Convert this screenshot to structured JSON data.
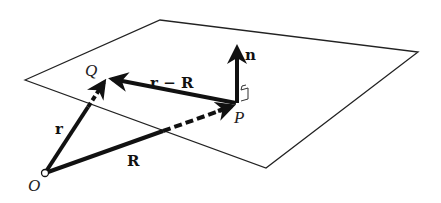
{
  "diagram": {
    "type": "vector-plane-geometry",
    "colors": {
      "stroke": "#111111",
      "background": "#ffffff"
    },
    "plane": {
      "corners": [
        [
          25,
          80
        ],
        [
          160,
          20
        ],
        [
          418,
          52
        ],
        [
          266,
          168
        ]
      ]
    },
    "points": {
      "O": {
        "label": "O",
        "x": 45,
        "y": 173
      },
      "Q": {
        "label": "Q",
        "x": 106,
        "y": 78
      },
      "P": {
        "label": "P",
        "x": 236,
        "y": 103
      }
    },
    "vectors": {
      "r": {
        "label": "r",
        "from": "O",
        "to": "Q",
        "style": "solid-then-dashed-below-plane"
      },
      "R": {
        "label": "R",
        "from": "O",
        "to": "P",
        "style": "solid-then-dashed-below-plane"
      },
      "r_minus_R": {
        "label": "r − R",
        "from": "P",
        "to": "Q",
        "style": "solid"
      },
      "n": {
        "label": "n",
        "from": "P",
        "direction": "up",
        "style": "solid",
        "note": "normal vector, with right-angle marker"
      }
    }
  }
}
